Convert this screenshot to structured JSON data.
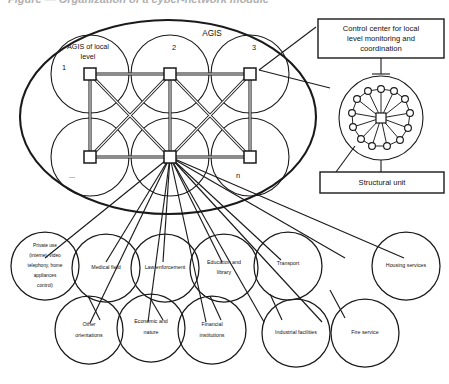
{
  "caption": "Figure — Organization of a cyber-network module",
  "diagram": {
    "outer_label": "AGIS",
    "local_label": "AGIS of local level",
    "agis_nodes": [
      {
        "id": "n1",
        "label": "1",
        "cx": 90,
        "cy": 74,
        "circle_cx": 90,
        "circle_cy": 74,
        "r": 39
      },
      {
        "id": "n2",
        "label": "2",
        "cx": 170,
        "cy": 74,
        "circle_cx": 170,
        "circle_cy": 74,
        "r": 39
      },
      {
        "id": "n3",
        "label": "3",
        "cx": 250,
        "cy": 74,
        "circle_cx": 250,
        "circle_cy": 74,
        "r": 39
      },
      {
        "id": "n4",
        "label": "...",
        "cx": 90,
        "cy": 157,
        "circle_cx": 90,
        "circle_cy": 157,
        "r": 39
      },
      {
        "id": "n5",
        "label": "",
        "cx": 170,
        "cy": 157,
        "circle_cx": 170,
        "circle_cy": 157,
        "r": 39
      },
      {
        "id": "n6",
        "label": "n",
        "cx": 250,
        "cy": 157,
        "circle_cx": 250,
        "circle_cy": 157,
        "r": 39
      }
    ],
    "callouts": [
      {
        "id": "control-center",
        "label": "Control center for local level monitoring and coordination",
        "lines": [
          "Control center for local",
          "level monitoring and",
          "coordination"
        ]
      },
      {
        "id": "structural-unit",
        "label": "Structural unit",
        "lines": [
          "Structural unit"
        ]
      }
    ],
    "structural_unit": {
      "ring_count": 13,
      "hub_shape": "square"
    },
    "leaf_row_1": [
      {
        "id": "private-use",
        "lines": [
          "Private use",
          "(internet, video",
          "telephony, home",
          "appliances",
          "control)"
        ],
        "label": "Private use (internet, video telephony, home appliances control)"
      },
      {
        "id": "medical-field",
        "lines": [
          "Medical field"
        ],
        "label": "Medical field"
      },
      {
        "id": "law-enforcement",
        "lines": [
          "Law enforcement"
        ],
        "label": "Law enforcement"
      },
      {
        "id": "education-library",
        "lines": [
          "Education and",
          "library"
        ],
        "label": "Education and library"
      },
      {
        "id": "transport",
        "lines": [
          "Transport"
        ],
        "label": "Transport"
      },
      {
        "id": "housing-services",
        "lines": [
          "Housing services"
        ],
        "label": "Housing services"
      }
    ],
    "leaf_row_2": [
      {
        "id": "other-orientations",
        "lines": [
          "Other",
          "orientations"
        ],
        "label": "Other orientations"
      },
      {
        "id": "economic-nature",
        "lines": [
          "Economic and",
          "nature"
        ],
        "label": "Economic and nature"
      },
      {
        "id": "financial-institutions",
        "lines": [
          "Financial",
          "institutions"
        ],
        "label": "Financial institutions"
      },
      {
        "id": "industrial-facilities",
        "lines": [
          "Industrial facilities"
        ],
        "label": "Industrial facilities"
      },
      {
        "id": "fire-service",
        "lines": [
          "Fire service"
        ],
        "label": "Fire service"
      }
    ]
  },
  "colors": {
    "ink": "#1a1a1a",
    "paper": "#ffffff",
    "caption": "#6e6e6e"
  }
}
